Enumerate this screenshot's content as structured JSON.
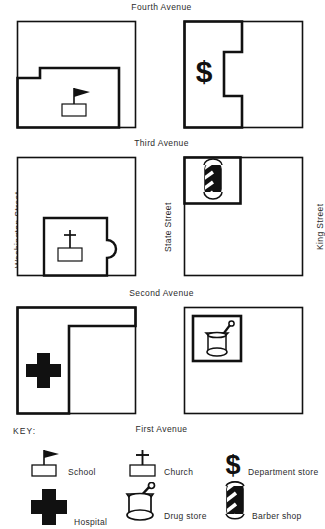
{
  "map": {
    "avenues": [
      {
        "name": "Fourth Avenue"
      },
      {
        "name": "Third Avenue"
      },
      {
        "name": "Second Avenue"
      },
      {
        "name": "First Avenue"
      }
    ],
    "streets": [
      {
        "name": "Washington Street"
      },
      {
        "name": "State Street"
      },
      {
        "name": "King Street"
      }
    ],
    "blocks": [
      {
        "id": "block-school",
        "landmark": "School",
        "position": "top-left",
        "lot_shape": "notched-L lower portion"
      },
      {
        "id": "block-department",
        "landmark": "Department store",
        "position": "top-right",
        "lot_shape": "left column with right-side notch"
      },
      {
        "id": "block-church",
        "landmark": "Church",
        "position": "middle-left",
        "lot_shape": "square with rounded bump on right"
      },
      {
        "id": "block-barber",
        "landmark": "Barber shop",
        "position": "middle-right",
        "lot_shape": "rectangle at upper-left corner"
      },
      {
        "id": "block-hospital",
        "landmark": "Hospital",
        "position": "bottom-left",
        "lot_shape": "L-shaped left column plus top strip"
      },
      {
        "id": "block-drug",
        "landmark": "Drug store",
        "position": "bottom-right",
        "lot_shape": "square at upper-left area"
      }
    ]
  },
  "key": {
    "title": "KEY:",
    "items": [
      {
        "icon": "school-flag-icon",
        "label": "School"
      },
      {
        "icon": "church-cross-icon",
        "label": "Church"
      },
      {
        "icon": "dollar-sign-icon",
        "label": "Department store"
      },
      {
        "icon": "hospital-cross-icon",
        "label": "Hospital"
      },
      {
        "icon": "mortar-pestle-icon",
        "label": "Drug store"
      },
      {
        "icon": "barber-pole-icon",
        "label": "Barber shop"
      }
    ]
  },
  "colors": {
    "ink": "#111111",
    "paper": "#ffffff",
    "text": "#2b2b2b"
  }
}
